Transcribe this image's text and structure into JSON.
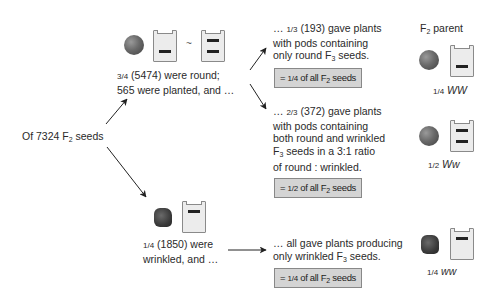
{
  "root": {
    "text_pre": "Of 7324 F",
    "sub": "2",
    "text_post": " seeds"
  },
  "round_branch": {
    "frac": "3/4",
    "line1": " (5474) were round;",
    "line2": "565 were planted, and …",
    "tilde": "~"
  },
  "wrinkled_branch": {
    "frac": "1/4",
    "line1": " (1850) were",
    "line2": "wrinkled, and …"
  },
  "outcomes": [
    {
      "prefix": "… ",
      "frac": "1/3",
      "line1": " (193) gave plants",
      "line2": "with pods containing",
      "line3_pre": "only round F",
      "line3_sub": "3",
      "line3_post": " seeds.",
      "box_pre": "= ",
      "box_frac": "1/4",
      "box_mid": " of all F",
      "box_sub": "2",
      "box_post": " seeds"
    },
    {
      "prefix": "… ",
      "frac": "2/3",
      "line1": " (372) gave plants",
      "line2": "with pods containing",
      "line3": "both round and wrinkled",
      "line4_pre": "F",
      "line4_sub": "3",
      "line4_post": " seeds in a 3:1 ratio",
      "line5": "of round : wrinkled.",
      "box_pre": "= ",
      "box_frac": "1/2",
      "box_mid": " of all F",
      "box_sub": "2",
      "box_post": " seeds"
    },
    {
      "line1": "… all gave plants producing",
      "line2_pre": "only wrinkled F",
      "line2_sub": "3",
      "line2_post": " seeds.",
      "box_pre": "= ",
      "box_frac": "1/4",
      "box_mid": " of all F",
      "box_sub": "2",
      "box_post": " seeds"
    }
  ],
  "parent_header": {
    "pre": "F",
    "sub": "2",
    "post": " parent"
  },
  "parents": [
    {
      "frac": "1/4",
      "genotype": "WW"
    },
    {
      "frac": "1/2",
      "genotype": "Ww"
    },
    {
      "frac": "1/4",
      "genotype": "ww"
    }
  ],
  "colors": {
    "box_fill": "#d4d4d4",
    "arrow": "#222222",
    "pod_fill": "#ececec"
  }
}
